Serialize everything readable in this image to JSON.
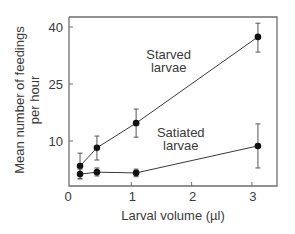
{
  "chart_data": {
    "type": "line",
    "title": "",
    "xlabel": "Larval volume (µl)",
    "ylabel": "Mean number of feedings per hour",
    "ylabel_lines": [
      "Mean number of feedings",
      "per hour"
    ],
    "xlim": [
      0,
      3.4
    ],
    "ylim": [
      -1.5,
      42.5
    ],
    "xticks": [
      0,
      1,
      2,
      3
    ],
    "xtick_labels": [
      "0",
      "1",
      "2",
      "3"
    ],
    "yticks": [
      10,
      25,
      40
    ],
    "ytick_labels": [
      "10",
      "25",
      "40"
    ],
    "grid": false,
    "legend": "none (inline annotations)",
    "series": [
      {
        "name": "Starved larvae",
        "label_lines": [
          "Starved",
          "larvae"
        ],
        "x": [
          0.15,
          0.43,
          1.08,
          3.1
        ],
        "y": [
          3.4,
          8.2,
          14.7,
          37.4
        ],
        "err_low": [
          0.2,
          5.0,
          11.0,
          33.4
        ],
        "err_high": [
          6.8,
          11.3,
          18.4,
          41.0
        ],
        "annotation_pos": {
          "x": 1.62,
          "y": 31.5
        }
      },
      {
        "name": "Satiated larvae",
        "label_lines": [
          "Satiated",
          "larvae"
        ],
        "x": [
          0.15,
          0.43,
          1.08,
          3.1
        ],
        "y": [
          1.3,
          1.8,
          1.6,
          8.7
        ],
        "err_low": [
          0.0,
          0.8,
          0.6,
          2.9
        ],
        "err_high": [
          2.6,
          2.9,
          2.6,
          14.5
        ],
        "annotation_pos": {
          "x": 1.82,
          "y": 11.0
        }
      }
    ]
  },
  "colors": {
    "line": "#3a3a3a",
    "axis": "#6e6e6e",
    "text": "#3a3a3a"
  }
}
